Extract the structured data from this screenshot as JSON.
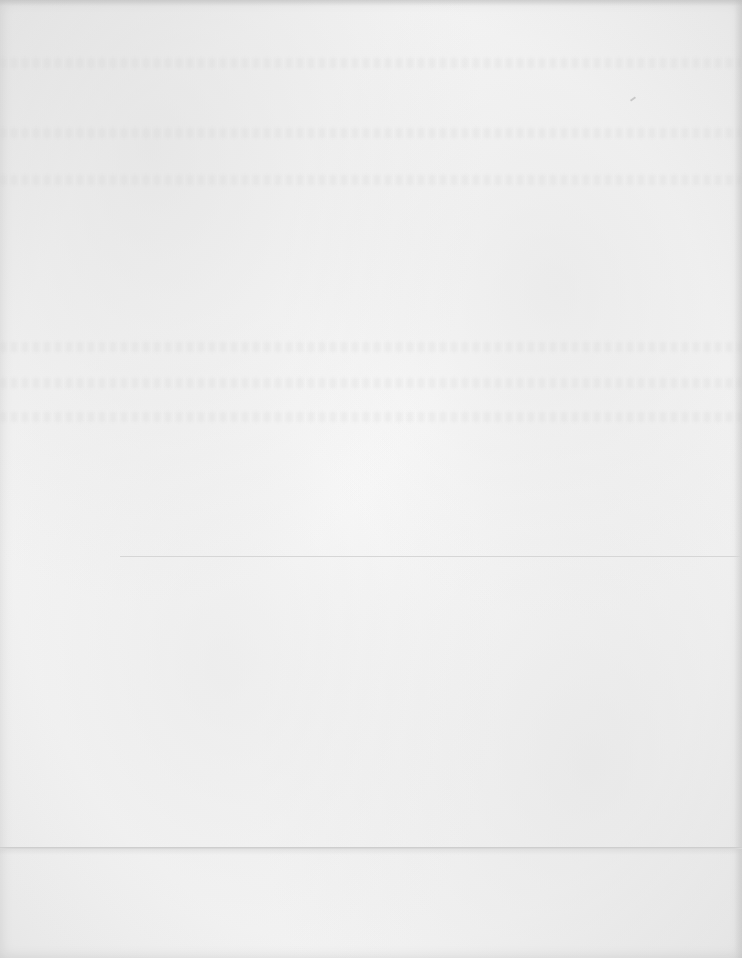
{
  "document": {
    "type": "blank-scanned-page",
    "text_content": "",
    "features": {
      "horizontal_rule": {
        "visible": true
      },
      "fold_line": {
        "visible": true
      }
    },
    "colors": {
      "paper": "#f5f5f5",
      "rule": "#d6d6d6",
      "fold": "#c9c9c9"
    }
  }
}
